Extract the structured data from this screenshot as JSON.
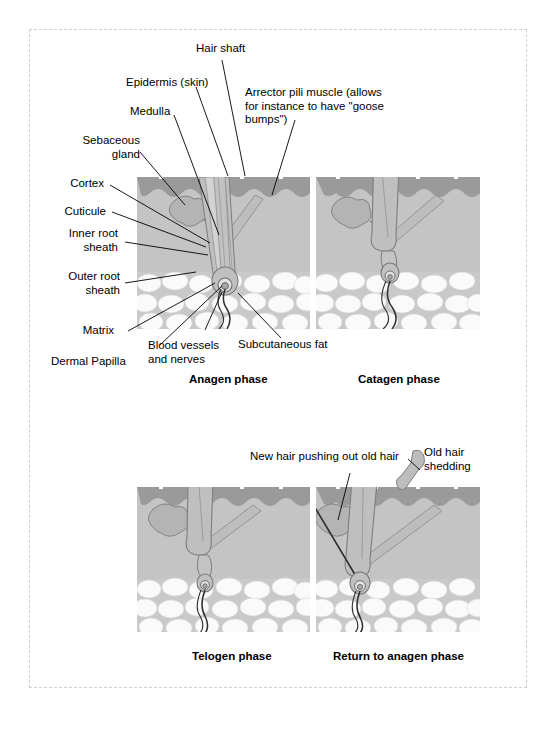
{
  "figure": {
    "border_color": "#cfcfcf"
  },
  "colors": {
    "epidermis": "#9a9a9a",
    "dermis": "#c3c3c3",
    "subcutaneous_fat_cell": "#f7f7f7",
    "fat_background": "#c9c9c9",
    "follicle_fill": "#bdbdbd",
    "hair_shaft": "#b5b5b5",
    "outline": "#6b6b6b",
    "leader_line": "#000000",
    "text": "#000000"
  },
  "labels": [
    {
      "id": "hair-shaft",
      "text": "Hair shaft"
    },
    {
      "id": "epidermis",
      "text": "Epidermis (skin)"
    },
    {
      "id": "medulla",
      "text": "Medulla"
    },
    {
      "id": "sebaceous-gland",
      "text": "Sebaceous\ngland"
    },
    {
      "id": "cortex",
      "text": "Cortex"
    },
    {
      "id": "cuticule",
      "text": "Cuticule"
    },
    {
      "id": "inner-root-sheath",
      "text": "Inner root\nsheath"
    },
    {
      "id": "outer-root-sheath",
      "text": "Outer root\nsheath"
    },
    {
      "id": "matrix",
      "text": "Matrix"
    },
    {
      "id": "dermal-papilla",
      "text": "Dermal Papilla"
    },
    {
      "id": "blood-vessels",
      "text": "Blood vessels\nand nerves"
    },
    {
      "id": "subcutaneous-fat",
      "text": "Subcutaneous fat"
    },
    {
      "id": "arrector-pili",
      "text": "Arrector pili muscle (allows\nfor instance to have \"goose\nbumps\")"
    },
    {
      "id": "new-hair",
      "text": "New hair pushing out old hair"
    },
    {
      "id": "old-hair",
      "text": "Old hair\nshedding"
    }
  ],
  "panels": [
    {
      "id": "anagen",
      "caption": "Anagen phase"
    },
    {
      "id": "catagen",
      "caption": "Catagen phase"
    },
    {
      "id": "telogen",
      "caption": "Telogen phase"
    },
    {
      "id": "return-anagen",
      "caption": "Return to anagen phase"
    }
  ]
}
